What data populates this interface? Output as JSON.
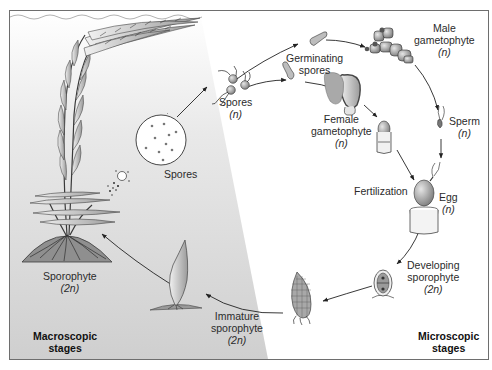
{
  "diagram": {
    "regions": {
      "macroscopic": {
        "line1": "Macroscopic",
        "line2": "stages"
      },
      "microscopic": {
        "line1": "Microscopic",
        "line2": "stages"
      }
    },
    "labels": {
      "sporophyte": {
        "line1": "Sporophyte",
        "ploidy": "(2n)"
      },
      "spores_callout": {
        "line1": "Spores"
      },
      "spores": {
        "line1": "Spores",
        "ploidy": "(n)"
      },
      "germinating_spores": {
        "line1": "Germinating",
        "line2": "spores"
      },
      "male_gametophyte": {
        "line1": "Male",
        "line2": "gametophyte",
        "ploidy": "(n)"
      },
      "female_gametophyte": {
        "line1": "Female",
        "line2": "gametophyte",
        "ploidy": "(n)"
      },
      "sperm": {
        "line1": "Sperm",
        "ploidy": "(n)"
      },
      "fertilization": {
        "line1": "Fertilization"
      },
      "egg": {
        "line1": "Egg",
        "ploidy": "(n)"
      },
      "developing_sporophyte": {
        "line1": "Developing",
        "line2": "sporophyte",
        "ploidy": "(2n)"
      },
      "immature_sporophyte": {
        "line1": "Immature",
        "line2": "sporophyte",
        "ploidy": "(2n)"
      }
    },
    "colors": {
      "frame": "#6e6e6e",
      "macroscopic_bg_top": "#ffffff",
      "macroscopic_bg_bottom": "#d2d2d2",
      "organism_fill": "#b9b9b9",
      "organism_stroke": "#4a4a4a",
      "arrow": "#222222"
    }
  }
}
